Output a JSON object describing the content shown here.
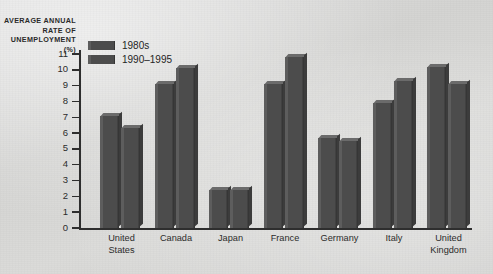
{
  "chart_data": {
    "type": "bar",
    "title": "",
    "ylabel": "AVERAGE ANNUAL RATE OF UNEMPLOYMENT (%)",
    "xlabel": "",
    "ylim": [
      0,
      11
    ],
    "ytick_labels": [
      "11",
      "10",
      "9",
      "8",
      "7",
      "6",
      "5",
      "4",
      "3",
      "2",
      "1",
      "0"
    ],
    "ytick_values": [
      11,
      10,
      9,
      8,
      7,
      6,
      5,
      4,
      3,
      2,
      1,
      0
    ],
    "grid": false,
    "legend_position": "top-left",
    "categories": [
      "United States",
      "Canada",
      "Japan",
      "France",
      "Germany",
      "Italy",
      "United Kingdom"
    ],
    "category_lines": [
      [
        "United",
        "States"
      ],
      [
        "Canada"
      ],
      [
        "Japan"
      ],
      [
        "France"
      ],
      [
        "Germany"
      ],
      [
        "Italy"
      ],
      [
        "United",
        "Kingdom"
      ]
    ],
    "series": [
      {
        "name": "1980s",
        "color": "#4c4c4c",
        "values": [
          7.1,
          9.1,
          2.4,
          9.1,
          5.7,
          7.9,
          10.2
        ]
      },
      {
        "name": "1990–1995",
        "color": "#4c4c4c",
        "values": [
          6.3,
          10.1,
          2.4,
          10.8,
          5.5,
          9.3,
          9.1
        ]
      }
    ]
  },
  "legend": {
    "items": [
      {
        "label": "1980s"
      },
      {
        "label": "1990–1995"
      }
    ]
  },
  "colors": {
    "bar": "#4c4c4c",
    "bar_light_edge": "#5d5d5d",
    "bar_top_face": "#6b6b6b",
    "bar_right_face": "#3c3c3c",
    "axis": "#2e2e2e",
    "text": "#2b2b2b",
    "background": "#d6d6d4"
  }
}
